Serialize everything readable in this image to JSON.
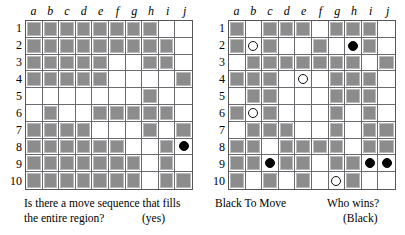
{
  "colors": {
    "filled_cell": "#8c8c8c",
    "cell_highlight": "#b9b9b9",
    "grid_line": "#6a6a70",
    "board_border": "#55555a",
    "black_stone": "#000000",
    "white_stone": "#ffffff"
  },
  "column_labels": [
    "a",
    "b",
    "c",
    "d",
    "e",
    "f",
    "g",
    "h",
    "i",
    "j"
  ],
  "row_labels": [
    "1",
    "2",
    "3",
    "4",
    "5",
    "6",
    "7",
    "8",
    "9",
    "10"
  ],
  "boards": [
    {
      "id": "left-board",
      "name": "region-fill-puzzle",
      "rows": [
        [
          "filled",
          "filled",
          "filled",
          "filled",
          "filled",
          "filled",
          "filled",
          "filled",
          "empty",
          "empty"
        ],
        [
          "filled",
          "filled",
          "filled",
          "filled",
          "filled",
          "filled",
          "filled",
          "filled",
          "filled",
          "empty"
        ],
        [
          "filled",
          "filled",
          "filled",
          "filled",
          "filled",
          "empty",
          "empty",
          "filled",
          "filled",
          "empty"
        ],
        [
          "filled",
          "filled",
          "filled",
          "filled",
          "filled",
          "empty",
          "empty",
          "empty",
          "empty",
          "filled"
        ],
        [
          "empty",
          "empty",
          "empty",
          "empty",
          "empty",
          "empty",
          "empty",
          "filled",
          "empty",
          "empty"
        ],
        [
          "empty",
          "filled",
          "empty",
          "empty",
          "filled",
          "filled",
          "filled",
          "filled",
          "filled",
          "empty"
        ],
        [
          "filled",
          "filled",
          "filled",
          "filled",
          "empty",
          "empty",
          "empty",
          "filled",
          "empty",
          "filled"
        ],
        [
          "filled",
          "filled",
          "filled",
          "filled",
          "filled",
          "filled",
          "empty",
          "empty",
          "filled",
          "empty"
        ],
        [
          "filled",
          "filled",
          "filled",
          "filled",
          "filled",
          "filled",
          "filled",
          "empty",
          "filled",
          "empty"
        ],
        [
          "filled",
          "filled",
          "filled",
          "filled",
          "filled",
          "filled",
          "filled",
          "empty",
          "filled",
          "filled"
        ]
      ],
      "stones": [
        {
          "row": 8,
          "col": "j",
          "color": "black"
        }
      ]
    },
    {
      "id": "right-board",
      "name": "black-to-move-puzzle",
      "rows": [
        [
          "filled",
          "empty",
          "filled",
          "filled",
          "filled",
          "empty",
          "filled",
          "filled",
          "filled",
          "empty"
        ],
        [
          "filled",
          "empty",
          "filled",
          "empty",
          "empty",
          "filled",
          "empty",
          "empty",
          "filled",
          "empty"
        ],
        [
          "empty",
          "filled",
          "filled",
          "filled",
          "filled",
          "filled",
          "filled",
          "filled",
          "empty",
          "filled"
        ],
        [
          "filled",
          "filled",
          "filled",
          "empty",
          "empty",
          "empty",
          "filled",
          "filled",
          "filled",
          "empty"
        ],
        [
          "empty",
          "filled",
          "filled",
          "empty",
          "empty",
          "empty",
          "filled",
          "filled",
          "filled",
          "empty"
        ],
        [
          "filled",
          "empty",
          "filled",
          "empty",
          "empty",
          "empty",
          "filled",
          "empty",
          "filled",
          "empty"
        ],
        [
          "empty",
          "filled",
          "filled",
          "filled",
          "empty",
          "empty",
          "filled",
          "empty",
          "filled",
          "filled"
        ],
        [
          "filled",
          "filled",
          "empty",
          "filled",
          "filled",
          "filled",
          "filled",
          "empty",
          "filled",
          "filled"
        ],
        [
          "filled",
          "filled",
          "empty",
          "filled",
          "filled",
          "empty",
          "filled",
          "filled",
          "empty",
          "empty"
        ],
        [
          "filled",
          "empty",
          "filled",
          "empty",
          "filled",
          "empty",
          "empty",
          "filled",
          "empty",
          "empty"
        ]
      ],
      "stones": [
        {
          "row": 2,
          "col": "b",
          "color": "white"
        },
        {
          "row": 2,
          "col": "h",
          "color": "black"
        },
        {
          "row": 4,
          "col": "e",
          "color": "white"
        },
        {
          "row": 6,
          "col": "b",
          "color": "white"
        },
        {
          "row": 9,
          "col": "c",
          "color": "black"
        },
        {
          "row": 9,
          "col": "i",
          "color": "black"
        },
        {
          "row": 9,
          "col": "j",
          "color": "black"
        },
        {
          "row": 10,
          "col": "g",
          "color": "white"
        }
      ]
    }
  ],
  "captions": {
    "left_line1": "Is there a move sequence that fills",
    "left_line2": "the entire region?",
    "left_answer": "(yes)",
    "right_to_move": "Black To Move",
    "right_question": "Who wins?",
    "right_answer": "(Black)"
  }
}
